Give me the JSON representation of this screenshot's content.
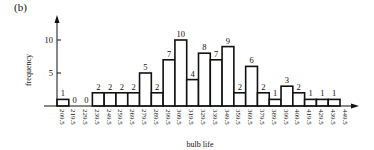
{
  "panel_label": "(b)",
  "chart_data": {
    "type": "bar",
    "subtype": "histogram",
    "title": "",
    "xlabel": "bulb life",
    "ylabel": "frequency",
    "bin_edges": [
      209.5,
      219.5,
      229.5,
      239.5,
      249.5,
      259.5,
      269.5,
      279.5,
      289.5,
      299.5,
      309.5,
      319.5,
      329.5,
      339.5,
      349.5,
      359.5,
      369.5,
      379.5,
      389.5,
      399.5,
      409.5,
      419.5,
      429.5,
      439.5,
      449.5
    ],
    "x_tick_labels": [
      "209.5",
      "219.5",
      "229.5",
      "239.5",
      "249.5",
      "259.5",
      "269.5",
      "279.5",
      "289.5",
      "299.5",
      "309.5",
      "319.5",
      "329.5",
      "339.5",
      "349.5",
      "359.5",
      "369.5",
      "379.5",
      "389.5",
      "399.5",
      "409.5",
      "419.5",
      "429.5",
      "439.5",
      "449.5"
    ],
    "values": [
      1,
      0,
      0,
      2,
      2,
      2,
      2,
      5,
      2,
      7,
      10,
      4,
      8,
      7,
      9,
      2,
      6,
      2,
      1,
      3,
      2,
      1,
      1,
      1
    ],
    "y_ticks": [
      5,
      10
    ],
    "ylim": [
      0,
      12
    ],
    "xlim": [
      209.5,
      449.5
    ],
    "grid": false,
    "legend": null,
    "data_labels_shown": true
  }
}
